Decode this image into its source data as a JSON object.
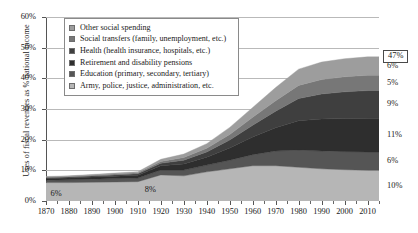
{
  "chart_data": {
    "type": "area",
    "title": "",
    "xlabel": "",
    "ylabel": "Uses of fiscal revenues as % national income",
    "xlim": [
      1870,
      2015
    ],
    "ylim": [
      0,
      60
    ],
    "grid": true,
    "stacked": true,
    "legend_position": "top-left-inside",
    "x_ticks": [
      "1870",
      "1880",
      "1890",
      "1900",
      "1910",
      "1920",
      "1930",
      "1940",
      "1950",
      "1960",
      "1970",
      "1980",
      "1990",
      "2000",
      "2010"
    ],
    "y_ticks": [
      "0%",
      "10%",
      "20%",
      "30%",
      "40%",
      "50%",
      "60%"
    ],
    "x": [
      1870,
      1880,
      1890,
      1900,
      1910,
      1920,
      1930,
      1940,
      1950,
      1960,
      1970,
      1980,
      1990,
      2000,
      2010,
      2015
    ],
    "series": [
      {
        "name": "Army, police, justice, administration, etc.",
        "color": "#b6b6b6",
        "end_label": "10%",
        "values": [
          6,
          6,
          6.1,
          6.2,
          6.3,
          8.5,
          8.2,
          9.5,
          10.5,
          11.5,
          11.5,
          11,
          10.5,
          10.2,
          10,
          10
        ]
      },
      {
        "name": "Education (primary, secondary, tertiary)",
        "color": "#555555",
        "end_label": "6%",
        "values": [
          0.8,
          0.9,
          1,
          1.1,
          1.2,
          1.6,
          1.9,
          2.2,
          2.8,
          3.6,
          4.8,
          5.6,
          5.8,
          5.9,
          6,
          6
        ]
      },
      {
        "name": "Retirement and disability pensions",
        "color": "#2e2e2e",
        "end_label": "11%",
        "values": [
          0.5,
          0.6,
          0.7,
          0.8,
          0.9,
          1.4,
          2,
          2.6,
          4,
          5.8,
          7.6,
          9.6,
          10.4,
          10.8,
          11,
          11
        ]
      },
      {
        "name": "Health (health insurance, hospitals, etc.)",
        "color": "#3f3f3f",
        "end_label": "9%",
        "values": [
          0.3,
          0.3,
          0.35,
          0.4,
          0.45,
          0.8,
          1.2,
          1.7,
          2.6,
          3.8,
          5.4,
          7.2,
          8.2,
          8.7,
          9,
          9
        ]
      },
      {
        "name": "Social transfers (family, unemployment, etc.)",
        "color": "#777777",
        "end_label": "5%",
        "values": [
          0.2,
          0.2,
          0.25,
          0.3,
          0.35,
          0.6,
          0.9,
          1.2,
          1.8,
          2.6,
          3.4,
          4.3,
          4.7,
          4.9,
          5,
          5
        ]
      },
      {
        "name": "Other social spending",
        "color": "#9d9d9d",
        "end_label": "6%",
        "values": [
          0.2,
          0.2,
          0.25,
          0.3,
          0.35,
          0.7,
          1.1,
          1.5,
          2.3,
          3.2,
          4.3,
          5.3,
          5.7,
          5.9,
          6,
          6
        ]
      }
    ],
    "annotations": [
      {
        "name": "start-total",
        "text": "6%",
        "x": 1872,
        "y": 2.2
      },
      {
        "name": "mid-total",
        "text": "8%",
        "x": 1913,
        "y": 3.6
      }
    ],
    "total_label": {
      "text": "47%",
      "value": 47
    }
  }
}
